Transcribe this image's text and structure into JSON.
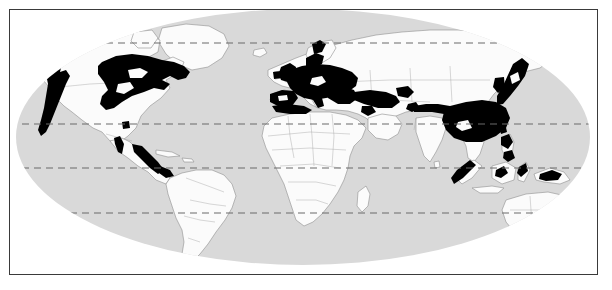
{
  "figure": {
    "kind": "world-distribution-map",
    "projection": "elliptical-robinson",
    "caption": ""
  },
  "frame": {
    "border_color": "#3a3a3a",
    "border_width_px": 1.5,
    "outer_background": "#ffffff"
  },
  "map": {
    "ocean_color": "#d9d9d9",
    "land_color": "#fbfbfb",
    "land_outline_color": "#8f8f8f",
    "highlight_color": "#000000",
    "graticule_color": "#6b6b6b",
    "globe": {
      "center_x": 299,
      "center_y": 131,
      "radius_x": 289,
      "radius_y": 131
    }
  },
  "graticule": {
    "style": "dashed",
    "dash_pattern": "7 5",
    "lines": [
      {
        "name": "arctic-circle",
        "label": "",
        "y": 42
      },
      {
        "name": "tropic-of-cancer",
        "label": "",
        "y": 123
      },
      {
        "name": "equator",
        "label": "",
        "y": 167
      },
      {
        "name": "tropic-of-capricorn",
        "label": "",
        "y": 212
      }
    ]
  },
  "legend": {
    "entries": []
  },
  "labels": [],
  "chart_data": {
    "type": "map",
    "title": "",
    "xlabel": "",
    "ylabel": "",
    "series": [
      {
        "name": "distribution-range",
        "color": "#000000",
        "regions": [
          "Pacific Northwest / US West Coast",
          "Eastern United States / Southeastern Canada",
          "Central Mexico highlands",
          "Western & Central Europe",
          "British Isles",
          "Iberian Peninsula / Mediterranean coast",
          "Italy / Balkans",
          "Anatolia / Caucasus / Black Sea",
          "Himalaya / Northern India belt",
          "Southern & Eastern China",
          "Korea and Japan",
          "Taiwan",
          "Philippines",
          "Sumatra highlands",
          "Borneo / Sulawesi highlands",
          "New Guinea highlands"
        ]
      }
    ]
  }
}
